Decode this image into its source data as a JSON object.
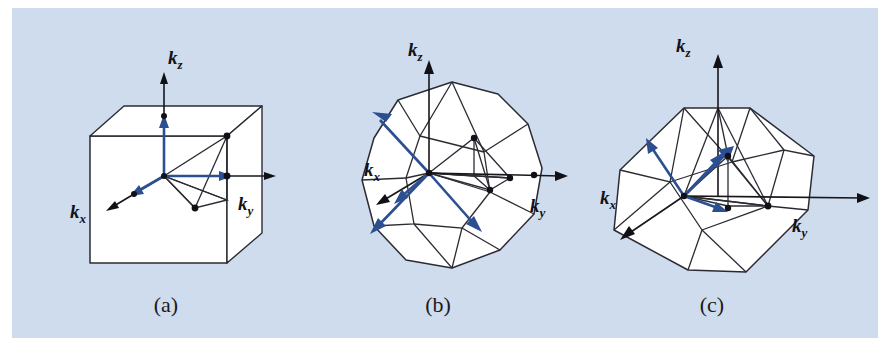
{
  "figure": {
    "background_color": "#cfdced",
    "page_color": "#ffffff",
    "line_color": "#2b2b33",
    "vector_color": "#2b4f91",
    "width": 890,
    "height": 346
  },
  "panels": [
    {
      "id": "panel-a",
      "caption": "(a)",
      "zone_name": "simple-cubic-brillouin-zone",
      "shape": "cube",
      "axes": [
        {
          "name": "kz",
          "label_k": "k",
          "label_sub": "z"
        },
        {
          "name": "kx",
          "label_k": "k",
          "label_sub": "x"
        },
        {
          "name": "ky",
          "label_k": "k",
          "label_sub": "y"
        }
      ],
      "vector_count": 3
    },
    {
      "id": "panel-b",
      "caption": "(b)",
      "zone_name": "bcc-brillouin-zone",
      "shape": "truncated-octahedron",
      "axes": [
        {
          "name": "kz",
          "label_k": "k",
          "label_sub": "z"
        },
        {
          "name": "kx",
          "label_k": "k",
          "label_sub": "x"
        },
        {
          "name": "ky",
          "label_k": "k",
          "label_sub": "y"
        }
      ],
      "vector_count": 4
    },
    {
      "id": "panel-c",
      "caption": "(c)",
      "zone_name": "fcc-brillouin-zone",
      "shape": "rhombic-dodecahedron",
      "axes": [
        {
          "name": "kz",
          "label_k": "k",
          "label_sub": "z"
        },
        {
          "name": "kx",
          "label_k": "k",
          "label_sub": "x"
        },
        {
          "name": "ky",
          "label_k": "k",
          "label_sub": "y"
        }
      ],
      "vector_count": 4
    }
  ],
  "captions": {
    "a": "(a)",
    "b": "(b)",
    "c": "(c)"
  },
  "labels": {
    "k": "k",
    "x": "x",
    "y": "y",
    "z": "z"
  }
}
